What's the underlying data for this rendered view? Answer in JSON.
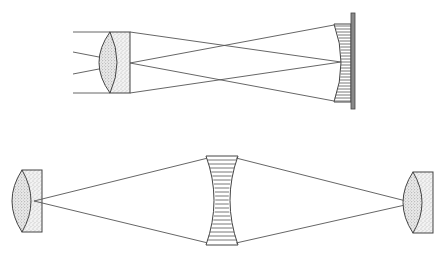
{
  "figure": {
    "type": "optical-ray-diagram",
    "colors": {
      "background": "#ffffff",
      "line": "#555555",
      "glass_fill": "#e6e6e6"
    },
    "panels": [
      {
        "name": "top-panel",
        "description": "Parallel rays pass through a plano-convex lens assembly and cross, reflecting from a hatched concave mirror on a vertical plate",
        "elements": [
          "incident-rays",
          "stippled-lens",
          "crossing-rays",
          "hatched-concave-mirror",
          "mirror-backing-plate"
        ]
      },
      {
        "name": "bottom-panel",
        "description": "Rays from a stippled lens on the left diverge to a hatched biconcave element in the middle, then converge to a stippled lens on the right",
        "elements": [
          "left-stippled-lens",
          "diverging-rays",
          "hatched-biconcave-element",
          "converging-rays",
          "right-stippled-lens"
        ]
      }
    ]
  }
}
